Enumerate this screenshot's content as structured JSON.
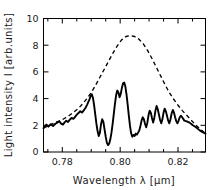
{
  "figure": {
    "background_color": "#ffffff",
    "foreground_color": "#000000"
  },
  "chart_data": {
    "type": "line",
    "title": "",
    "subtitle": "",
    "xlabel": "Wavelength  λ  [µm]",
    "ylabel": "Light intensity  I  [arb.units]",
    "xlim": [
      0.7735,
      0.8295
    ],
    "ylim": [
      0,
      10
    ],
    "xticks": [
      0.78,
      0.8,
      0.82
    ],
    "xticklabels": [
      "0.78",
      "0.80",
      "0.82"
    ],
    "xminorticks": [
      0.775,
      0.785,
      0.79,
      0.795,
      0.805,
      0.81,
      0.815,
      0.825
    ],
    "yticks": [
      0,
      2,
      4,
      6,
      8,
      10
    ],
    "yticklabels": [
      "0",
      "2",
      "4",
      "6",
      "8",
      "10"
    ],
    "grid": false,
    "legend": null,
    "frame": "box",
    "tick_direction": "in",
    "annotations": [],
    "series": [
      {
        "name": "envelope",
        "style": "dashed",
        "color": "#000000",
        "x": [
          0.7735,
          0.775,
          0.7765,
          0.778,
          0.7795,
          0.781,
          0.7825,
          0.784,
          0.7855,
          0.787,
          0.7885,
          0.79,
          0.7915,
          0.793,
          0.7945,
          0.796,
          0.7975,
          0.799,
          0.8005,
          0.802,
          0.8035,
          0.805,
          0.8065,
          0.808,
          0.8095,
          0.811,
          0.8125,
          0.814,
          0.8155,
          0.817,
          0.8185,
          0.82,
          0.8215,
          0.823,
          0.8245,
          0.826,
          0.8275,
          0.8295
        ],
        "y": [
          1.8,
          1.95,
          2.1,
          2.25,
          2.35,
          2.55,
          2.75,
          3.0,
          3.25,
          3.6,
          4.0,
          4.45,
          5.0,
          5.6,
          6.2,
          6.8,
          7.4,
          7.95,
          8.4,
          8.65,
          8.72,
          8.65,
          8.45,
          8.1,
          7.6,
          7.0,
          6.35,
          5.7,
          5.05,
          4.45,
          3.95,
          3.5,
          3.1,
          2.75,
          2.4,
          2.05,
          1.75,
          1.4
        ]
      },
      {
        "name": "modulated-spectrum",
        "style": "solid",
        "color": "#000000",
        "x": [
          0.7735,
          0.7745,
          0.7752,
          0.776,
          0.7768,
          0.7776,
          0.7784,
          0.779,
          0.7796,
          0.7802,
          0.7808,
          0.7814,
          0.782,
          0.7826,
          0.7832,
          0.7838,
          0.7844,
          0.785,
          0.7856,
          0.7862,
          0.7868,
          0.7874,
          0.788,
          0.7886,
          0.789,
          0.7894,
          0.7898,
          0.7902,
          0.7906,
          0.791,
          0.7914,
          0.7918,
          0.7922,
          0.7926,
          0.793,
          0.7934,
          0.7938,
          0.7942,
          0.7946,
          0.795,
          0.7954,
          0.7958,
          0.7962,
          0.7966,
          0.797,
          0.7974,
          0.7978,
          0.7982,
          0.7986,
          0.799,
          0.7994,
          0.7998,
          0.8002,
          0.8006,
          0.801,
          0.8014,
          0.8018,
          0.8022,
          0.8026,
          0.803,
          0.8034,
          0.8038,
          0.8042,
          0.8046,
          0.805,
          0.8054,
          0.8058,
          0.8062,
          0.8066,
          0.807,
          0.8074,
          0.8078,
          0.8082,
          0.8086,
          0.809,
          0.8094,
          0.8098,
          0.8102,
          0.8106,
          0.811,
          0.8114,
          0.8118,
          0.8122,
          0.8126,
          0.813,
          0.8134,
          0.8138,
          0.8142,
          0.8146,
          0.815,
          0.8154,
          0.8158,
          0.8162,
          0.8166,
          0.817,
          0.8174,
          0.8178,
          0.8182,
          0.8186,
          0.819,
          0.8194,
          0.8198,
          0.8202,
          0.8206,
          0.821,
          0.8216,
          0.8222,
          0.823,
          0.824,
          0.825,
          0.8262,
          0.8275,
          0.8285,
          0.8295
        ],
        "y": [
          1.78,
          2.05,
          1.9,
          2.08,
          1.95,
          2.12,
          2.22,
          2.3,
          2.12,
          2.05,
          2.22,
          2.35,
          2.25,
          2.42,
          2.55,
          2.48,
          2.62,
          2.8,
          2.92,
          3.05,
          2.95,
          3.12,
          3.3,
          3.55,
          3.75,
          3.95,
          4.2,
          4.32,
          4.05,
          3.5,
          2.8,
          2.1,
          1.55,
          1.2,
          1.45,
          2.1,
          2.45,
          2.25,
          1.7,
          1.15,
          0.7,
          0.52,
          0.62,
          0.95,
          1.45,
          2.1,
          2.85,
          3.6,
          4.25,
          4.6,
          4.45,
          4.1,
          4.35,
          4.8,
          5.15,
          5.2,
          4.9,
          4.3,
          3.55,
          2.7,
          1.95,
          1.4,
          1.15,
          1.28,
          1.2,
          1.38,
          1.3,
          1.45,
          1.6,
          1.95,
          2.35,
          2.6,
          2.45,
          2.1,
          1.85,
          2.2,
          2.75,
          3.1,
          2.95,
          2.55,
          2.2,
          2.55,
          3.1,
          3.45,
          3.2,
          2.8,
          2.4,
          2.15,
          2.45,
          2.95,
          3.25,
          3.05,
          2.7,
          2.35,
          2.15,
          2.45,
          2.9,
          3.15,
          2.95,
          2.6,
          2.3,
          2.15,
          2.35,
          2.6,
          2.72,
          2.55,
          2.35,
          2.3,
          2.2,
          2.02,
          1.85,
          1.62,
          1.48,
          1.38
        ]
      }
    ]
  }
}
